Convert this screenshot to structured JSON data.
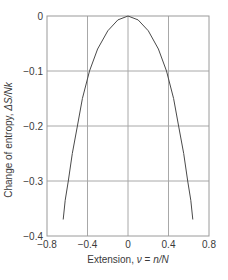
{
  "chart_data": {
    "type": "line",
    "title": "",
    "xlabel": "Extension, ν = n/N",
    "ylabel": "Change of entropy, ΔS/Nk",
    "xlim": [
      -0.8,
      0.8
    ],
    "ylim": [
      -0.4,
      0
    ],
    "xticks": [
      -0.8,
      -0.4,
      0,
      0.4,
      0.8
    ],
    "xtick_labels": [
      "−0.8",
      "−0.4",
      "0",
      "0.4",
      "0.8"
    ],
    "yticks": [
      0,
      -0.1,
      -0.2,
      -0.3,
      -0.4
    ],
    "ytick_labels": [
      "0",
      "−0.1",
      "−0.2",
      "−0.3",
      "−0.4"
    ],
    "grid": true,
    "legend": null,
    "series": [
      {
        "name": "ΔS/Nk",
        "color": "#4a4a4a",
        "x": [
          -0.64,
          -0.62,
          -0.59,
          -0.55,
          -0.5,
          -0.45,
          -0.38,
          -0.3,
          -0.2,
          -0.1,
          0,
          0.1,
          0.2,
          0.3,
          0.38,
          0.45,
          0.5,
          0.55,
          0.59,
          0.62,
          0.64
        ],
        "y": [
          -0.37,
          -0.335,
          -0.3,
          -0.25,
          -0.2,
          -0.15,
          -0.1,
          -0.06,
          -0.027,
          -0.007,
          0,
          -0.007,
          -0.027,
          -0.06,
          -0.1,
          -0.15,
          -0.2,
          -0.25,
          -0.3,
          -0.335,
          -0.37
        ]
      }
    ]
  },
  "colors": {
    "grid": "#a8a8a8",
    "axis": "#9a9a9a",
    "curve": "#4a4a4a",
    "text": "#3a3a3a"
  },
  "labels": {
    "xlabel_prefix": "Extension, ",
    "xlabel_var": "ν",
    "xlabel_eq": " = ",
    "xlabel_rhs": "n/N",
    "ylabel_prefix": "Change of entropy, ",
    "ylabel_var": "ΔS/Nk"
  }
}
